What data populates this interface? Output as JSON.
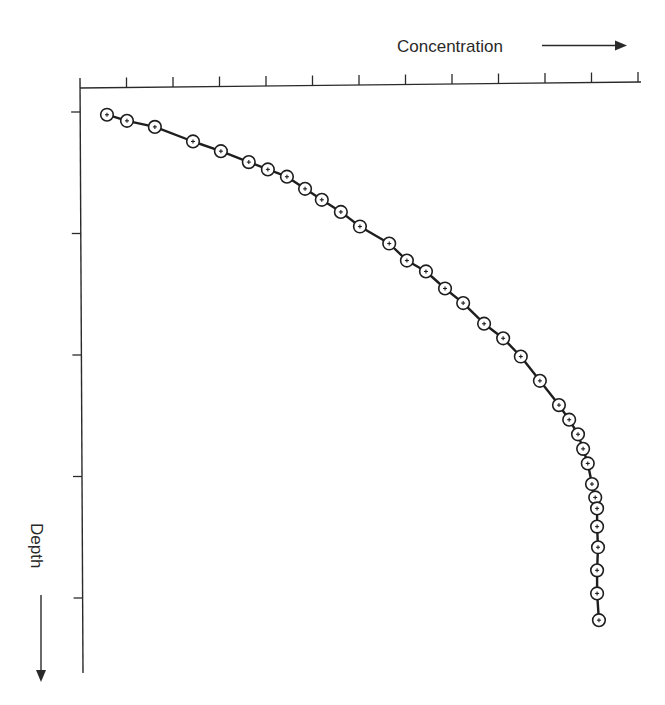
{
  "chart_data": {
    "type": "line",
    "title": "",
    "xlabel": "Concentration",
    "ylabel": "Depth",
    "x_axis_position": "top",
    "y_axis_direction": "increasing downward",
    "x_ticks": 12,
    "y_ticks": 5,
    "tick_labels": "none",
    "xlim": [
      0,
      12.2
    ],
    "ylim": [
      0,
      4.85
    ],
    "grid": false,
    "legend": null,
    "marker": "circle-with-plus",
    "series": [
      {
        "name": "Concentration profile",
        "x": [
          0.58,
          1.01,
          1.61,
          2.43,
          3.03,
          3.63,
          4.04,
          4.45,
          4.84,
          5.2,
          5.61,
          6.02,
          6.65,
          7.03,
          7.44,
          7.85,
          8.24,
          8.69,
          9.1,
          9.48,
          9.89,
          10.3,
          10.52,
          10.71,
          10.82,
          10.92,
          11.01,
          11.08,
          11.12,
          11.12,
          11.14,
          11.12,
          11.12,
          11.16
        ],
        "y": [
          0.22,
          0.27,
          0.32,
          0.44,
          0.52,
          0.61,
          0.67,
          0.73,
          0.83,
          0.92,
          1.02,
          1.14,
          1.28,
          1.42,
          1.51,
          1.65,
          1.77,
          1.94,
          2.06,
          2.21,
          2.41,
          2.61,
          2.73,
          2.85,
          2.97,
          3.09,
          3.26,
          3.37,
          3.46,
          3.61,
          3.78,
          3.97,
          4.16,
          4.38
        ]
      }
    ]
  },
  "labels": {
    "x_axis": "Concentration",
    "y_axis": "Depth"
  },
  "layout": {
    "origin_px": [
      80,
      88
    ],
    "x_unit_px": 46.5,
    "y_unit_px": 121.5,
    "x_axis_end_px": 641,
    "y_axis_end_px": 673
  }
}
